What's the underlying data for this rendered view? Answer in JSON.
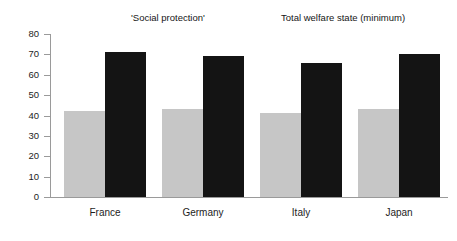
{
  "chart_data": {
    "type": "bar",
    "title": "",
    "subtitle": "",
    "xlabel": "",
    "ylabel": "",
    "categories": [
      "France",
      "Germany",
      "Italy",
      "Japan"
    ],
    "series": [
      {
        "name": "'Social protection'",
        "color": "#c6c6c6",
        "values": [
          42,
          43,
          41,
          43
        ]
      },
      {
        "name": "Total welfare state (minimum)",
        "color": "#141414",
        "values": [
          71,
          69,
          66,
          70
        ]
      }
    ],
    "ylim": [
      0,
      80
    ],
    "yticks": [
      0,
      10,
      20,
      30,
      40,
      50,
      60,
      70,
      80
    ],
    "ytick_labels": [
      "0",
      "10",
      "20",
      "30",
      "40",
      "50",
      "60",
      "70",
      "80"
    ],
    "grid": false,
    "legend_position": "top",
    "background_color": "#ffffff",
    "axis_color": "#9a9a9a"
  },
  "legend": {
    "entries": [
      {
        "label": "'Social protection'",
        "color": "#c6c6c6"
      },
      {
        "label": "Total welfare state (minimum)",
        "color": "#141414"
      }
    ]
  }
}
